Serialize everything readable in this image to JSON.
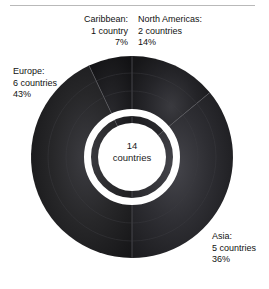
{
  "chart_data": {
    "type": "pie",
    "variant": "donut",
    "title": "",
    "subtitle": "",
    "xlabel": "",
    "ylabel": "",
    "legend_position": "callout-labels",
    "grid": false,
    "total": {
      "value": "14",
      "unit": "countries"
    },
    "categories": [
      "North Americas",
      "Asia",
      "Europe",
      "Caribbean"
    ],
    "values": [
      14,
      36,
      43,
      7
    ],
    "counts": [
      2,
      5,
      6,
      1
    ],
    "unit": "countries",
    "value_unit": "%",
    "slices": [
      {
        "name": "North Americas",
        "label_name": "North Americas:",
        "count_text": "2 countries",
        "percent_text": "14%",
        "percent": 14,
        "count": 2,
        "color": "#1d1d1f",
        "start_angle": 0,
        "end_angle": 50.4
      },
      {
        "name": "Asia",
        "label_name": "Asia:",
        "count_text": "5 countries",
        "percent_text": "36%",
        "percent": 36,
        "count": 5,
        "color": "#2c2c30",
        "start_angle": 50.4,
        "end_angle": 180
      },
      {
        "name": "Europe",
        "label_name": "Europe:",
        "count_text": "6 countries",
        "percent_text": "43%",
        "percent": 43,
        "count": 6,
        "color": "#232326",
        "start_angle": 180,
        "end_angle": 334.8
      },
      {
        "name": "Caribbean",
        "label_name": "Caribbean:",
        "count_text": "1 country",
        "percent_text": "7%",
        "percent": 7,
        "count": 1,
        "color": "#151517",
        "start_angle": 334.8,
        "end_angle": 360
      }
    ]
  },
  "colors": {
    "background": "#ffffff",
    "rule": "#b9b9b9",
    "ring": "#ffffff",
    "text": "#111111",
    "divider": "#4a4a4e"
  }
}
